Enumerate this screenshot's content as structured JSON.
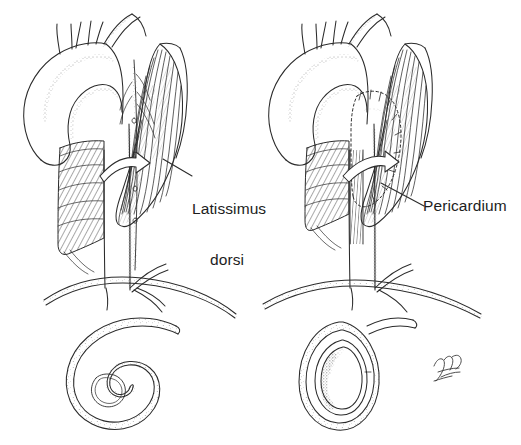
{
  "figure": {
    "kind": "medical-line-illustration",
    "background_color": "#ffffff",
    "ink_color": "#2b2b2b",
    "width": 521,
    "height": 445
  },
  "labels": {
    "latissimus": {
      "line1": "Latissimus",
      "line2": "dorsi",
      "text": "Latissimus dorsi"
    },
    "pericardium": {
      "text": "Pericardium"
    }
  },
  "panels": [
    {
      "id": "left-panel",
      "position": "left",
      "description": "Aortic arch with descending aorta, latissimus dorsi muscle flap, curved transposition arrow, diaphragm, and coiled spiral cross-section below",
      "label": "Latissimus dorsi",
      "arrow": "curved-arrow-right",
      "cross_section": "spiral-coil"
    },
    {
      "id": "right-panel",
      "position": "right",
      "description": "Aortic arch with pericardial patch sutured over defect, latissimus dorsi muscle, curved transposition arrow, diaphragm, and oval cross-section below",
      "label": "Pericardium",
      "arrow": "curved-arrow-right",
      "cross_section": "oval-ring"
    }
  ],
  "signature": {
    "present": true,
    "name": "artist-signature",
    "location": "bottom-right"
  }
}
